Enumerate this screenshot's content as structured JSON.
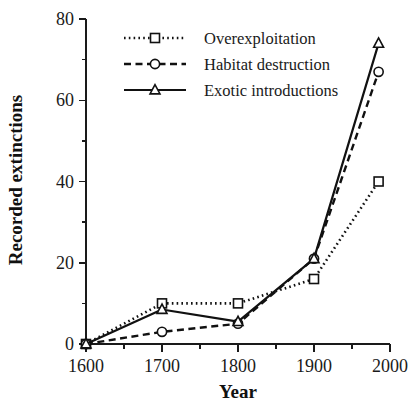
{
  "chart_data": {
    "type": "line",
    "title": "",
    "xlabel": "Year",
    "ylabel": "Recorded extinctions",
    "xlim": [
      1600,
      2000
    ],
    "ylim": [
      0,
      80
    ],
    "grid": false,
    "legend_position": "top-left",
    "x_ticks_major": [
      1600,
      1700,
      1800,
      1900,
      2000
    ],
    "x_ticks_minor": [
      1650,
      1750,
      1850,
      1950
    ],
    "y_ticks_major": [
      0,
      20,
      40,
      60,
      80
    ],
    "y_ticks_minor": [
      10,
      30,
      50,
      70
    ],
    "x": [
      1600,
      1700,
      1800,
      1900,
      1985
    ],
    "series": [
      {
        "name": "Overexploitation",
        "marker": "square",
        "linestyle": "dotted",
        "color": "#111111",
        "values": [
          0,
          10,
          10,
          16,
          40
        ]
      },
      {
        "name": "Habitat destruction",
        "marker": "circle",
        "linestyle": "dashed",
        "color": "#111111",
        "values": [
          0,
          3,
          5,
          21,
          67
        ]
      },
      {
        "name": "Exotic introductions",
        "marker": "triangle",
        "linestyle": "solid",
        "color": "#111111",
        "values": [
          0,
          8.5,
          5.5,
          21,
          74
        ]
      }
    ]
  },
  "axes": {
    "x_tick_labels": [
      "1600",
      "1700",
      "1800",
      "1900",
      "2000"
    ],
    "y_tick_labels": [
      "0",
      "20",
      "40",
      "60",
      "80"
    ],
    "x_title": "Year",
    "y_title": "Recorded extinctions"
  },
  "legend": {
    "entries": [
      {
        "label": "Overexploitation"
      },
      {
        "label": "Habitat destruction"
      },
      {
        "label": "Exotic introductions"
      }
    ]
  }
}
